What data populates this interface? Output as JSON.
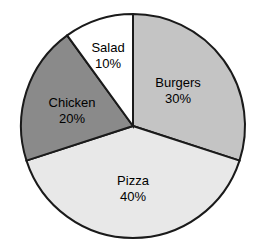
{
  "chart_data": {
    "type": "pie",
    "title": "",
    "subtitle": "",
    "xlabel": "",
    "ylabel": "",
    "grid": false,
    "legend_position": "none",
    "labels_inside_slices": true,
    "start_angle_deg": 0,
    "direction": "clockwise",
    "categories": [
      "Burgers",
      "Pizza",
      "Chicken",
      "Salad"
    ],
    "values": [
      30,
      40,
      20,
      10
    ],
    "value_suffix": "%",
    "slices": [
      {
        "name": "Burgers",
        "value": 30,
        "value_text": "30%",
        "color": "#c4c4c4",
        "start_deg": 0,
        "end_deg": 108,
        "label_x": 178,
        "label_y": 91
      },
      {
        "name": "Pizza",
        "value": 40,
        "value_text": "40%",
        "color": "#e8e8e8",
        "start_deg": 108,
        "end_deg": 252,
        "label_x": 133,
        "label_y": 189
      },
      {
        "name": "Chicken",
        "value": 20,
        "value_text": "20%",
        "color": "#8a8a8a",
        "start_deg": 252,
        "end_deg": 324,
        "label_x": 72,
        "label_y": 111
      },
      {
        "name": "Salad",
        "value": 10,
        "value_text": "10%",
        "color": "#ffffff",
        "start_deg": 324,
        "end_deg": 360,
        "label_x": 108,
        "label_y": 56
      }
    ],
    "geometry": {
      "center_x": 133,
      "center_y": 126,
      "radius": 112
    },
    "style": {
      "background": "#ffffff",
      "outline_color": "#1a1a1a",
      "outline_width": 2,
      "label_color": "#000000"
    }
  }
}
